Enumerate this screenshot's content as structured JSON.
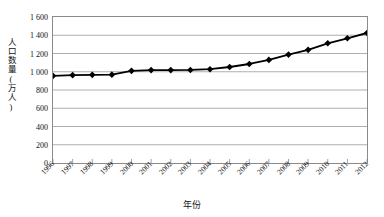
{
  "chart_data": {
    "type": "line",
    "title": "",
    "xlabel": "年份",
    "ylabel": "人口数量(万人)",
    "categories": [
      "1996",
      "1997",
      "1998",
      "1999",
      "2000",
      "2001",
      "2002",
      "2003",
      "2004",
      "2005",
      "2006",
      "2007",
      "2008",
      "2009",
      "2010",
      "2011",
      "2012"
    ],
    "values": [
      955,
      963,
      966,
      968,
      1010,
      1018,
      1018,
      1020,
      1028,
      1052,
      1085,
      1130,
      1188,
      1240,
      1312,
      1367,
      1425
    ],
    "series": [
      {
        "name": "人口数量",
        "values": [
          955,
          963,
          966,
          968,
          1010,
          1018,
          1018,
          1020,
          1028,
          1052,
          1085,
          1130,
          1188,
          1240,
          1312,
          1367,
          1425
        ]
      }
    ],
    "ylim": [
      0,
      1600
    ],
    "ytick_values": [
      0,
      200,
      400,
      600,
      800,
      1000,
      1200,
      1400,
      1600
    ],
    "ytick_labels": [
      "0",
      "200",
      "400",
      "600",
      "800",
      "1 000",
      "1 200",
      "1 400",
      "1 600"
    ],
    "grid": "horizontal",
    "legend": "none",
    "marker": "diamond",
    "line_color": "#000000",
    "marker_color": "#000000",
    "grid_color": "#9a9a9a",
    "axis_color": "#8a8a8a"
  }
}
